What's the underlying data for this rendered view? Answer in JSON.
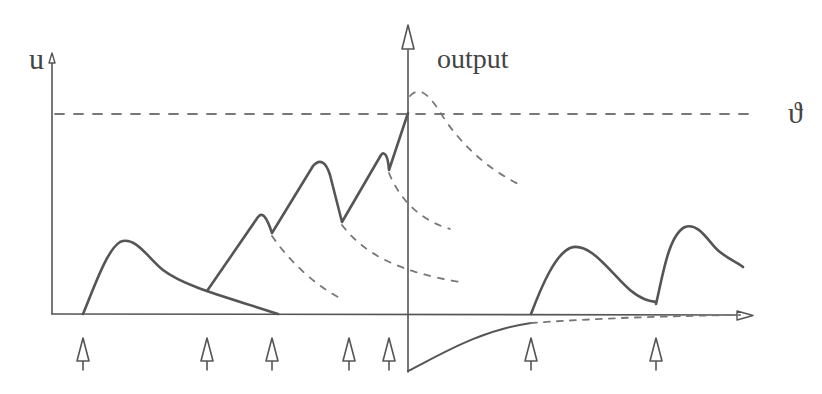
{
  "labels": {
    "y_axis": "u",
    "output_axis": "output",
    "threshold": "ϑ"
  },
  "colors": {
    "stroke": "#555555",
    "dashed": "#777777",
    "background": "#ffffff"
  },
  "diagram": {
    "input_spike_x": [
      83,
      207,
      272,
      349,
      389,
      531,
      656
    ],
    "output_spike_x": 408,
    "threshold_y": 114,
    "baseline_y": 314
  }
}
